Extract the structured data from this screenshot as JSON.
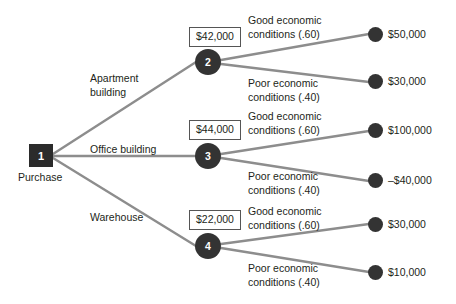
{
  "diagram": {
    "colors": {
      "node_fill": "#333333",
      "square_fill": "#2b2b2b",
      "edge": "#8d8d8d",
      "text": "#231f20",
      "box_border": "#555555",
      "background": "#ffffff"
    }
  },
  "decision_node": {
    "number": "1",
    "caption": "Purchase"
  },
  "branches": [
    {
      "alternative_label": "Apartment\nbuilding",
      "expected_value": "$42,000",
      "node_number": "2",
      "outcomes": [
        {
          "condition": "Good economic\nconditions (.60)",
          "payoff": "$50,000"
        },
        {
          "condition": "Poor economic\nconditions (.40)",
          "payoff": "$30,000"
        }
      ]
    },
    {
      "alternative_label": "Office building",
      "expected_value": "$44,000",
      "node_number": "3",
      "outcomes": [
        {
          "condition": "Good economic\nconditions (.60)",
          "payoff": "$100,000"
        },
        {
          "condition": "Poor economic\nconditions (.40)",
          "payoff": "–$40,000"
        }
      ]
    },
    {
      "alternative_label": "Warehouse",
      "expected_value": "$22,000",
      "node_number": "4",
      "outcomes": [
        {
          "condition": "Good economic\nconditions (.60)",
          "payoff": "$30,000"
        },
        {
          "condition": "Poor economic\nconditions (.40)",
          "payoff": "$10,000"
        }
      ]
    }
  ]
}
